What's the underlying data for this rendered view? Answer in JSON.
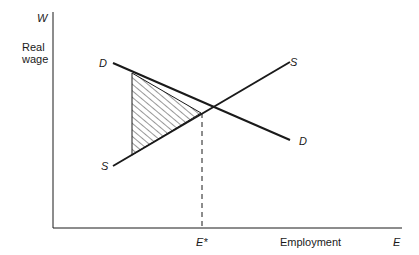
{
  "diagram": {
    "title": "",
    "y_axis": {
      "symbol": "W",
      "label_line1": "Real",
      "label_line2": "wage"
    },
    "x_axis": {
      "symbol": "E",
      "label": "Employment",
      "equilibrium_label": "E*"
    },
    "curves": {
      "demand": {
        "label_start": "D",
        "label_end": "D",
        "from": [
          113,
          63
        ],
        "to": [
          290,
          140
        ]
      },
      "supply": {
        "label_start": "S",
        "label_end": "S",
        "from": [
          113,
          166
        ],
        "to": [
          290,
          62
        ]
      }
    },
    "equilibrium_point": [
      201,
      113
    ],
    "shaded_region": {
      "description": "hatched welfare-loss triangle left of equilibrium",
      "vertices": [
        [
          132,
          73
        ],
        [
          201,
          113
        ],
        [
          132,
          155
        ]
      ]
    },
    "colors": {
      "line": "#1a1a1a",
      "background": "#ffffff"
    }
  }
}
